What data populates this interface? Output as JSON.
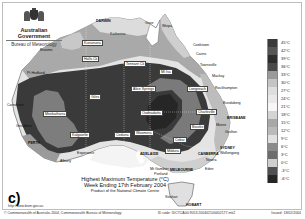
{
  "header": {
    "government": "Australian Government",
    "agency": "Bureau of Meteorology"
  },
  "map": {
    "title_line1": "Highest Maximum Temperature (°C)",
    "title_line2": "Week Ending 17th February 2004",
    "title_line3": "Product of the National Climate Centre",
    "panel_label": "c)",
    "url": "http://www.bom.gov.au",
    "cities": [
      {
        "name": "DARWIN",
        "x": 96,
        "y": 19,
        "boxed": false,
        "cap": true
      },
      {
        "name": "Weipa",
        "x": 162,
        "y": 24,
        "boxed": false
      },
      {
        "name": "Gove",
        "x": 145,
        "y": 21,
        "boxed": false
      },
      {
        "name": "Cooktown",
        "x": 193,
        "y": 43,
        "boxed": false
      },
      {
        "name": "Cairns",
        "x": 196,
        "y": 52,
        "boxed": false
      },
      {
        "name": "Townsville",
        "x": 200,
        "y": 63,
        "boxed": false
      },
      {
        "name": "Mackay",
        "x": 212,
        "y": 74,
        "boxed": false
      },
      {
        "name": "Rockhampton",
        "x": 215,
        "y": 86,
        "boxed": false
      },
      {
        "name": "Bundaberg",
        "x": 223,
        "y": 101,
        "boxed": false
      },
      {
        "name": "BRISBANE",
        "x": 227,
        "y": 116,
        "boxed": false,
        "cap": true
      },
      {
        "name": "Moree",
        "x": 216,
        "y": 123,
        "boxed": false
      },
      {
        "name": "Grafton",
        "x": 225,
        "y": 130,
        "boxed": false
      },
      {
        "name": "SYDNEY",
        "x": 220,
        "y": 146,
        "boxed": false,
        "cap": true
      },
      {
        "name": "Wollongong",
        "x": 220,
        "y": 151,
        "boxed": false
      },
      {
        "name": "Nowra",
        "x": 206,
        "y": 158,
        "boxed": false
      },
      {
        "name": "Eden",
        "x": 205,
        "y": 167,
        "boxed": false
      },
      {
        "name": "HOBART",
        "x": 186,
        "y": 203,
        "boxed": false,
        "cap": true
      },
      {
        "name": "Strahan",
        "x": 165,
        "y": 195,
        "boxed": false
      },
      {
        "name": "Katherine",
        "x": 110,
        "y": 32,
        "boxed": false
      },
      {
        "name": "Kununurra",
        "x": 82,
        "y": 40,
        "boxed": true
      },
      {
        "name": "Broome",
        "x": 40,
        "y": 48,
        "boxed": false
      },
      {
        "name": "Halls Ck",
        "x": 82,
        "y": 56,
        "boxed": true
      },
      {
        "name": "Tennant Ck",
        "x": 124,
        "y": 61,
        "boxed": true
      },
      {
        "name": "Mt Isa",
        "x": 159,
        "y": 69,
        "boxed": true
      },
      {
        "name": "Pt Hedland",
        "x": 27,
        "y": 71,
        "boxed": false
      },
      {
        "name": "Longreach",
        "x": 187,
        "y": 86,
        "boxed": true
      },
      {
        "name": "Alice Springs",
        "x": 131,
        "y": 86,
        "boxed": true
      },
      {
        "name": "Giles",
        "x": 89,
        "y": 94,
        "boxed": true
      },
      {
        "name": "Carnarvon",
        "x": 7,
        "y": 103,
        "boxed": false
      },
      {
        "name": "Oodnadatta",
        "x": 140,
        "y": 110,
        "boxed": true
      },
      {
        "name": "Meekatharra",
        "x": 43,
        "y": 111,
        "boxed": true
      },
      {
        "name": "Charleville",
        "x": 196,
        "y": 109,
        "boxed": true
      },
      {
        "name": "Bourke",
        "x": 190,
        "y": 124,
        "boxed": true
      },
      {
        "name": "Geraldton",
        "x": 16,
        "y": 124,
        "boxed": false
      },
      {
        "name": "Kalgoorlie",
        "x": 70,
        "y": 132,
        "boxed": true
      },
      {
        "name": "Ceduna",
        "x": 114,
        "y": 132,
        "boxed": true
      },
      {
        "name": "Woomera",
        "x": 134,
        "y": 130,
        "boxed": true
      },
      {
        "name": "Cobar",
        "x": 173,
        "y": 137,
        "boxed": true
      },
      {
        "name": "PERTH",
        "x": 28,
        "y": 141,
        "boxed": false,
        "cap": true
      },
      {
        "name": "Esperance",
        "x": 77,
        "y": 151,
        "boxed": false
      },
      {
        "name": "ADELAIDE",
        "x": 140,
        "y": 152,
        "boxed": false,
        "cap": true
      },
      {
        "name": "Albany",
        "x": 60,
        "y": 159,
        "boxed": false
      },
      {
        "name": "Mildura",
        "x": 165,
        "y": 148,
        "boxed": true
      },
      {
        "name": "CANBERRA",
        "x": 198,
        "y": 152,
        "boxed": false,
        "cap": true
      },
      {
        "name": "MELBOURNE",
        "x": 170,
        "y": 168,
        "boxed": false,
        "cap": true
      },
      {
        "name": "Mt Gambier",
        "x": 150,
        "y": 167,
        "boxed": false
      },
      {
        "name": "Portland",
        "x": 154,
        "y": 172,
        "boxed": false
      }
    ]
  },
  "legend": {
    "items": [
      {
        "label": "45°C",
        "color": "#3a3a3a"
      },
      {
        "label": "42°C",
        "color": "#555555"
      },
      {
        "label": "39°C",
        "color": "#2d2d2d"
      },
      {
        "label": "36°C",
        "color": "#4a4a4a"
      },
      {
        "label": "33°C",
        "color": "#9a9a9a"
      },
      {
        "label": "30°C",
        "color": "#c4c4c4"
      },
      {
        "label": "27°C",
        "color": "#dedede"
      },
      {
        "label": "24°C",
        "color": "#e9e9e9"
      },
      {
        "label": "21°C",
        "color": "#f7f7f7"
      },
      {
        "label": "18°C",
        "color": "#d4d4d4"
      },
      {
        "label": "15°C",
        "color": "#a8a8a8"
      },
      {
        "label": "12°C",
        "color": "#bababa"
      },
      {
        "label": "9°C",
        "color": "#e0e0e0"
      },
      {
        "label": "6°C",
        "color": "#8a8a8a"
      },
      {
        "label": "3°C",
        "color": "#6c6c6c"
      },
      {
        "label": "0°C",
        "color": "#cfcfcf"
      },
      {
        "label": "-3°C",
        "color": "#505050"
      },
      {
        "label": "-6°C",
        "color": "#262626"
      }
    ]
  },
  "footer": {
    "copyright": "© Commonwealth of Australia 2004, Commonwealth Bureau of Meteorology",
    "id_code": "ID code: IDCTCA00.9053.200402100402177.mk2",
    "issued": "Issued: 18/02/2004"
  }
}
